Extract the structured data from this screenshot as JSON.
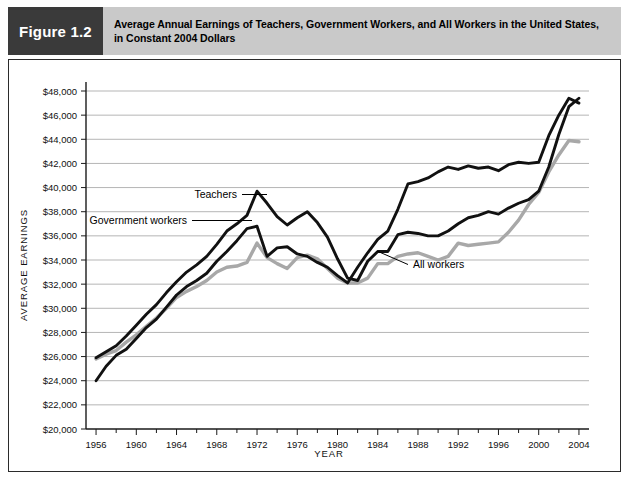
{
  "figure": {
    "tag": "Figure 1.2",
    "title_line1": "Average Annual Earnings of Teachers, Government Workers, and All Workers in the United States,",
    "title_line2": "in Constant 2004 Dollars"
  },
  "colors": {
    "tag_background": "#3a3a3a",
    "title_background": "#c9c9c9",
    "frame_border": "#2b2b2b",
    "gridline": "#b5b5b5",
    "axis": "#1a1a1a",
    "teachers": "#111111",
    "government_workers": "#111111",
    "all_workers": "#a8a8a8",
    "plot_background": "#ffffff"
  },
  "annotations": {
    "teachers_label": "Teachers",
    "government_label": "Government workers",
    "all_workers_label": "All workers"
  },
  "chart_data": {
    "type": "line",
    "title": "Average Annual Earnings of Teachers, Government Workers, and All Workers in the United States, in Constant 2004 Dollars",
    "subtitle": "",
    "xlabel": "YEAR",
    "ylabel": "AVERAGE EARNINGS",
    "xlim": [
      1955,
      2005
    ],
    "ylim": [
      20000,
      48000
    ],
    "ytick_step": 2000,
    "ytick_labels": [
      "$20,000",
      "$22,000",
      "$24,000",
      "$26,000",
      "$28,000",
      "$30,000",
      "$32,000",
      "$34,000",
      "$36,000",
      "$38,000",
      "$40,000",
      "$42,000",
      "$44,000",
      "$46,000",
      "$48,000"
    ],
    "ytick_values": [
      20000,
      22000,
      24000,
      26000,
      28000,
      30000,
      32000,
      34000,
      36000,
      38000,
      40000,
      42000,
      44000,
      46000,
      48000
    ],
    "xtick_labels": [
      "1956",
      "1960",
      "1964",
      "1968",
      "1972",
      "1976",
      "1980",
      "1984",
      "1988",
      "1992",
      "1996",
      "2000",
      "2004"
    ],
    "xtick_values": [
      1956,
      1960,
      1964,
      1968,
      1972,
      1976,
      1980,
      1984,
      1988,
      1992,
      1996,
      2000,
      2004
    ],
    "minor_xtick_step": 2,
    "grid": "horizontal",
    "legend_position": "inline-annotations",
    "x": [
      1956,
      1957,
      1958,
      1959,
      1960,
      1961,
      1962,
      1963,
      1964,
      1965,
      1966,
      1967,
      1968,
      1969,
      1970,
      1971,
      1972,
      1973,
      1974,
      1975,
      1976,
      1977,
      1978,
      1979,
      1980,
      1981,
      1982,
      1983,
      1984,
      1985,
      1986,
      1987,
      1988,
      1989,
      1990,
      1991,
      1992,
      1993,
      1994,
      1995,
      1996,
      1997,
      1998,
      1999,
      2000,
      2001,
      2002,
      2003,
      2004
    ],
    "series": [
      {
        "name": "Teachers",
        "color": "#111111",
        "values": [
          24000,
          25200,
          26100,
          26600,
          27500,
          28400,
          29100,
          30100,
          31100,
          31800,
          32300,
          32900,
          33900,
          34700,
          35600,
          36600,
          36800,
          34300,
          35000,
          35100,
          34500,
          34300,
          33800,
          33400,
          32700,
          32100,
          33400,
          34600,
          35700,
          36400,
          38200,
          40300,
          40500,
          40800,
          41300,
          41700,
          41500,
          41800,
          41600,
          41700,
          41400,
          41900,
          42100,
          42000,
          42100,
          44300,
          46000,
          47400,
          47000
        ]
      },
      {
        "name": "Government workers",
        "color": "#111111",
        "values": [
          25900,
          26400,
          26900,
          27700,
          28600,
          29500,
          30300,
          31300,
          32200,
          33000,
          33600,
          34300,
          35300,
          36400,
          37000,
          37700,
          39700,
          38700,
          37600,
          36900,
          37500,
          38000,
          37100,
          35900,
          34100,
          32500,
          32300,
          33900,
          34700,
          34700,
          36100,
          36300,
          36200,
          36000,
          36000,
          36400,
          37000,
          37500,
          37700,
          38000,
          37800,
          38300,
          38700,
          39000,
          39700,
          41700,
          44400,
          46700,
          47400
        ]
      },
      {
        "name": "All workers",
        "color": "#a8a8a8",
        "values": [
          25800,
          26200,
          26500,
          27200,
          27800,
          28500,
          29200,
          30000,
          30900,
          31400,
          31800,
          32300,
          33000,
          33400,
          33500,
          33800,
          35400,
          34200,
          33700,
          33300,
          34200,
          34400,
          34100,
          33300,
          32500,
          32100,
          32100,
          32500,
          33700,
          33700,
          34300,
          34500,
          34600,
          34300,
          34000,
          34300,
          35400,
          35200,
          35300,
          35400,
          35500,
          36300,
          37300,
          38600,
          39600,
          41300,
          42700,
          43900,
          43800
        ]
      }
    ]
  }
}
